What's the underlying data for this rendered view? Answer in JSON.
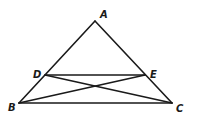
{
  "diagram": {
    "type": "geometry-triangle",
    "points": {
      "A": {
        "label": "A",
        "x": 95,
        "y": 21,
        "lx": 100,
        "ly": 18
      },
      "B": {
        "label": "B",
        "x": 19,
        "y": 103,
        "lx": 9,
        "ly": 111
      },
      "C": {
        "label": "C",
        "x": 172,
        "y": 103,
        "lx": 176,
        "ly": 112
      },
      "D": {
        "label": "D",
        "x": 45,
        "y": 75,
        "lx": 34,
        "ly": 78
      },
      "E": {
        "label": "E",
        "x": 145,
        "y": 75,
        "lx": 150,
        "ly": 78
      }
    },
    "segments": [
      [
        "A",
        "B"
      ],
      [
        "A",
        "C"
      ],
      [
        "B",
        "C"
      ],
      [
        "D",
        "E"
      ],
      [
        "D",
        "C"
      ],
      [
        "E",
        "B"
      ]
    ],
    "colors": {
      "stroke": "#1a1a1a",
      "background": "#ffffff"
    }
  }
}
